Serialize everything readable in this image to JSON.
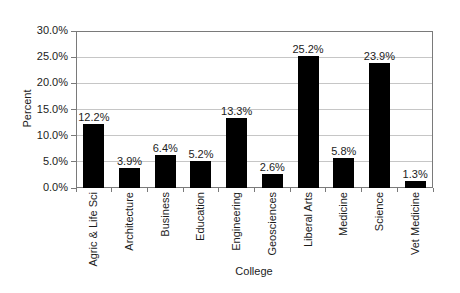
{
  "chart_data": {
    "type": "bar",
    "title": "",
    "xlabel": "College",
    "ylabel": "Percent",
    "categories": [
      "Agric & Life Sci",
      "Architecture",
      "Business",
      "Education",
      "Engineering",
      "Geosciences",
      "Liberal Arts",
      "Medicine",
      "Science",
      "Vet Medicine"
    ],
    "values": [
      12.2,
      3.9,
      6.4,
      5.2,
      13.3,
      2.6,
      25.2,
      5.8,
      23.9,
      1.3
    ],
    "bar_labels": [
      "12.2%",
      "3.9%",
      "6.4%",
      "5.2%",
      "13.3%",
      "2.6%",
      "25.2%",
      "5.8%",
      "23.9%",
      "1.3%"
    ],
    "ylim": [
      0,
      30
    ],
    "ytick_step": 5,
    "yticks": [
      "0.0%",
      "5.0%",
      "10.0%",
      "15.0%",
      "20.0%",
      "25.0%",
      "30.0%"
    ],
    "grid": true,
    "legend": "none",
    "bar_color": "#000000",
    "gridline_color": "#c6c6c6",
    "axis_color": "#7a7a7a"
  }
}
